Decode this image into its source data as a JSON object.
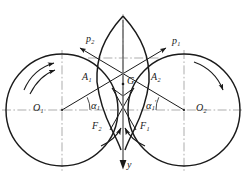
{
  "figure": {
    "type": "engineering-line-diagram",
    "background": "#ffffff",
    "stroke": "#1a1a1a",
    "centerline_color": "#8c8c8c"
  },
  "labels": {
    "center_left": {
      "text": "O",
      "sub": "1"
    },
    "center_right": {
      "text": "O",
      "sub": "2"
    },
    "point_a1": {
      "text": "A",
      "sub": "1"
    },
    "point_a2": {
      "text": "A",
      "sub": "2"
    },
    "point_g": {
      "text": "G",
      "sub": ""
    },
    "force_f1": {
      "text": "F",
      "sub": "1"
    },
    "force_f2": {
      "text": "F",
      "sub": "2"
    },
    "pressure_p1": {
      "text": "p",
      "sub": "1"
    },
    "pressure_p2": {
      "text": "p",
      "sub": "2"
    },
    "angle_left": {
      "text": "α",
      "sub": "1",
      "prime": ""
    },
    "angle_right": {
      "text": "α",
      "sub": "1",
      "prime": "′"
    },
    "axis_y": {
      "text": "y",
      "sub": ""
    }
  },
  "geometry": {
    "left_circle": {
      "cx": 62,
      "cy": 110,
      "r": 56
    },
    "right_circle": {
      "cx": 184,
      "cy": 110,
      "r": 56
    },
    "contact_point": {
      "x": 123,
      "y": 110
    },
    "g_point": {
      "x": 123,
      "y": 84
    },
    "a1_point": {
      "x": 97,
      "y": 82
    },
    "a2_point": {
      "x": 149,
      "y": 82
    },
    "y_axis": {
      "x": 123,
      "y_top": 12,
      "y_bottom": 170
    },
    "horizontal_centerline_y": 110,
    "alpha_angle_degrees": 25
  }
}
